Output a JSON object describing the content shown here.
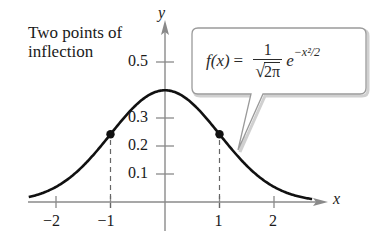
{
  "chart_data": {
    "type": "line",
    "title": "",
    "xlabel": "x",
    "ylabel": "y",
    "xlim": [
      -2.5,
      2.7
    ],
    "ylim": [
      0,
      0.55
    ],
    "grid": false,
    "x_ticks": [
      -2,
      -1,
      1,
      2
    ],
    "x_tick_labels": [
      "−2",
      "−1",
      "1",
      "2"
    ],
    "y_ticks": [
      0.1,
      0.2,
      0.3,
      0.5
    ],
    "y_tick_labels": [
      "0.1",
      "0.2",
      "0.3",
      "0.5"
    ],
    "series": [
      {
        "name": "f(x) = 1/√(2π) e^(−x²/2)",
        "function": "standard normal density",
        "x": [
          -2.5,
          -2,
          -1.5,
          -1,
          -0.5,
          0,
          0.5,
          1,
          1.5,
          2,
          2.5
        ],
        "y": [
          0.018,
          0.054,
          0.13,
          0.242,
          0.352,
          0.399,
          0.352,
          0.242,
          0.13,
          0.054,
          0.018
        ]
      }
    ],
    "points": [
      {
        "x": -1,
        "y": 0.242,
        "label": "inflection point"
      },
      {
        "x": 1,
        "y": 0.242,
        "label": "inflection point"
      }
    ],
    "dashed_guides": [
      {
        "x": -1,
        "from_y": 0,
        "to_y": 0.242
      },
      {
        "x": 1,
        "from_y": 0,
        "to_y": 0.242
      }
    ],
    "annotations": [
      {
        "text": "Two points of inflection",
        "position": "upper-left"
      },
      {
        "text": "f(x) = 1/√(2π) e^(−x²/2)",
        "position": "callout box, upper-right, pointing to curve"
      }
    ]
  },
  "annotation": {
    "line1": "Two points of",
    "line2": "inflection"
  },
  "formula": {
    "lhs_f": "f",
    "lhs_arg": "(x)",
    "equals": "=",
    "numerator": "1",
    "sqrt_sign": "√",
    "radicand": "2π",
    "base": "e",
    "exponent": "−x²/2"
  },
  "axes": {
    "x_label": "x",
    "y_label": "y"
  },
  "colors": {
    "curve": "#111111",
    "axis": "#8a8a8a",
    "dashed": "#666666",
    "callout_border": "#9a9a9a",
    "callout_shadow": "#d0d0d0"
  }
}
